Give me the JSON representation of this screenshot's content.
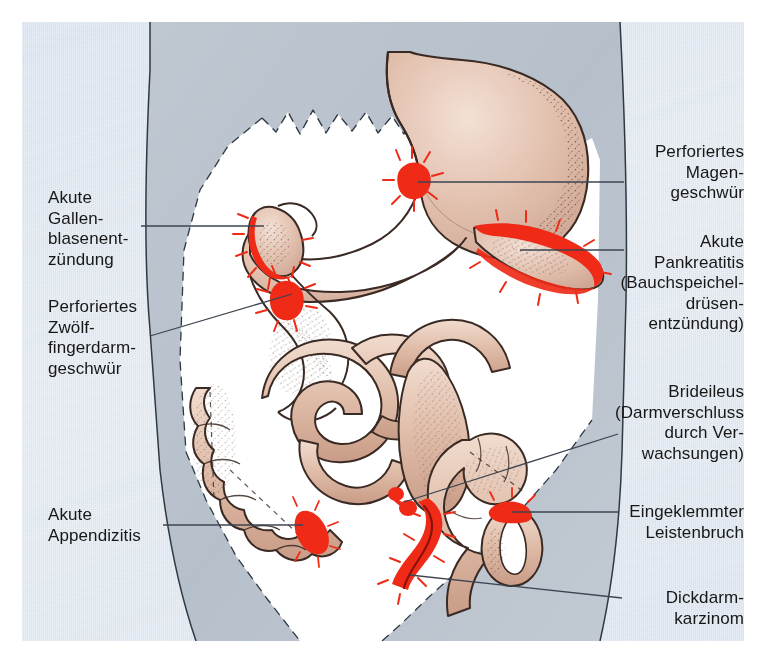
{
  "figure": {
    "type": "medical-anatomical-diagram",
    "language": "de"
  },
  "palette": {
    "page_background": "#eef2f7",
    "torso_grey": "#b6bfc9",
    "abdominal_cavity": "#ffffff",
    "organ_tissue": "#ddb9a8",
    "organ_tissue_light": "#eed6c7",
    "organ_outline": "#3a2a24",
    "inflammation_red": "#ef2b18",
    "leader_line": "#3b4450",
    "text": "#171717"
  },
  "labels": [
    {
      "id": "akute-cholezystitis",
      "side": "left",
      "lines": [
        "Akute",
        "Gallen-",
        "blasenent-",
        "zündung"
      ],
      "text": "Akute Gallenblasenentzündung"
    },
    {
      "id": "perforiertes-duodenalgeschwuer",
      "side": "left",
      "lines": [
        "Perforiertes",
        "Zwölf-",
        "fingerdarm-",
        "geschwür"
      ],
      "text": "Perforiertes Zwölffingerdarmgeschwür"
    },
    {
      "id": "akute-appendizitis",
      "side": "left",
      "lines": [
        "Akute",
        "Appendizitis"
      ],
      "text": "Akute Appendizitis"
    },
    {
      "id": "perforiertes-magengeschwuer",
      "side": "right",
      "lines": [
        "Perforiertes",
        "Magen-",
        "geschwür"
      ],
      "text": "Perforiertes Magengeschwür"
    },
    {
      "id": "akute-pankreatitis",
      "side": "right",
      "lines": [
        "Akute",
        "Pankreatitis",
        "(Bauchspeichel-",
        "drüsen-",
        "entzündung)"
      ],
      "text": "Akute Pankreatitis (Bauchspeicheldrüsenentzündung)"
    },
    {
      "id": "brideileus",
      "side": "right",
      "lines": [
        "Brideileus",
        "(Darmverschluss",
        "durch Ver-",
        "wachsungen)"
      ],
      "text": "Brideileus (Darmverschluss durch Verwachsungen)"
    },
    {
      "id": "eingeklemmter-leistenbruch",
      "side": "right",
      "lines": [
        "Eingeklemmter",
        "Leistenbruch"
      ],
      "text": "Eingeklemmter Leistenbruch"
    },
    {
      "id": "dickdarmkarzinom",
      "side": "right",
      "lines": [
        "Dickdarm-",
        "karzinom"
      ],
      "text": "Dickdarmkarzinom"
    }
  ],
  "organs": [
    {
      "id": "stomach",
      "name": "Magen"
    },
    {
      "id": "esophagus",
      "name": "Speiseröhre"
    },
    {
      "id": "duodenum",
      "name": "Zwölffingerdarm"
    },
    {
      "id": "gallbladder",
      "name": "Gallenblase"
    },
    {
      "id": "pancreas",
      "name": "Bauchspeicheldrüse"
    },
    {
      "id": "colon",
      "name": "Dickdarm"
    },
    {
      "id": "small-intestine",
      "name": "Dünndarm"
    },
    {
      "id": "appendix",
      "name": "Wurmfortsatz"
    },
    {
      "id": "hernia-loop",
      "name": "Bruchsack"
    }
  ]
}
